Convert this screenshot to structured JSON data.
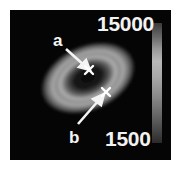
{
  "figure": {
    "colorbar": {
      "max_label": "15000",
      "min_label": "1500",
      "colormap": "grayscale"
    },
    "markers": [
      {
        "id": "a",
        "label": "a",
        "symbol": "×",
        "position": "center of ring (dark core)"
      },
      {
        "id": "b",
        "label": "b",
        "symbol": "×",
        "position": "outer edge of ring"
      }
    ],
    "colors": {
      "background": "#050505",
      "annotation": "#f2f2f2"
    }
  }
}
